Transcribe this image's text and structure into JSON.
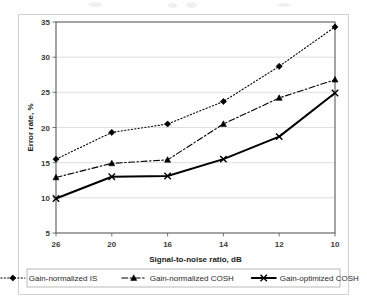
{
  "chart_data": {
    "type": "line",
    "title": "",
    "subtitle": "",
    "xlabel": "Signal-to-noise ratio, dB",
    "ylabel": "Error rate, %",
    "categories": [
      "26",
      "20",
      "16",
      "14",
      "12",
      "10"
    ],
    "x_tick_labels": [
      "26",
      "20",
      "16",
      "14",
      "12",
      "10"
    ],
    "y_tick_labels": [
      "5",
      "10",
      "15",
      "20",
      "25",
      "30",
      "35"
    ],
    "y_ticks": [
      5,
      10,
      15,
      20,
      25,
      30,
      35
    ],
    "ylim": [
      5,
      35
    ],
    "grid": "horizontal",
    "legend_position": "bottom",
    "series": [
      {
        "name": "Gain-normalized IS",
        "values": [
          15.5,
          19.3,
          20.5,
          23.7,
          28.7,
          34.3
        ],
        "line_style": "dotted",
        "marker": "diamond",
        "color": "#000000"
      },
      {
        "name": "Gain-normalized COSH",
        "values": [
          12.9,
          14.9,
          15.4,
          20.5,
          24.2,
          26.8
        ],
        "line_style": "dash-dot",
        "marker": "triangle",
        "color": "#000000"
      },
      {
        "name": "Gain-optimized COSH",
        "values": [
          9.9,
          13.0,
          13.1,
          15.5,
          18.7,
          24.9
        ],
        "line_style": "solid",
        "marker": "x",
        "color": "#000000"
      }
    ]
  },
  "figure": {
    "plot_area": {
      "left": 56,
      "top": 22,
      "right": 335,
      "bottom": 233
    },
    "legend": {
      "box": {
        "x": 27,
        "y": 269,
        "width": 313,
        "height": 18
      }
    },
    "colors": {
      "series_color": "#000000",
      "grid_color": "#d6d6d6",
      "frame_color": "#595959",
      "text_color": "#2b2b2b",
      "background": "#ffffff"
    }
  }
}
